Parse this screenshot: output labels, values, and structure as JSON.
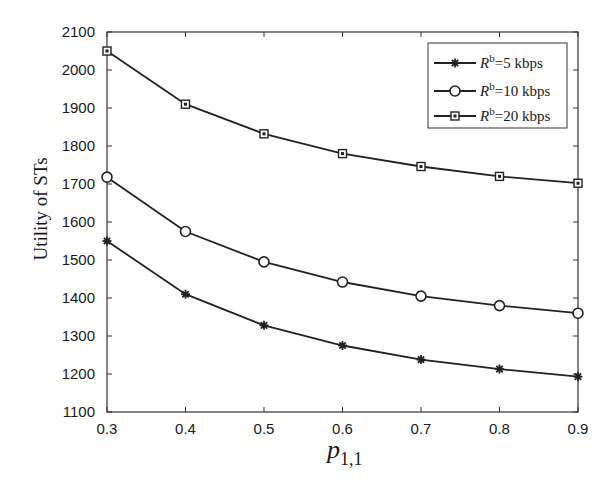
{
  "chart_data": {
    "type": "line",
    "title": "",
    "xlabel": "p_{1,1}",
    "xlabel_main": "p",
    "xlabel_sub": "1,1",
    "ylabel": "Utility of STs",
    "x": [
      0.3,
      0.4,
      0.5,
      0.6,
      0.7,
      0.8,
      0.9
    ],
    "xlim": [
      0.3,
      0.9
    ],
    "ylim": [
      1100,
      2100
    ],
    "xticks": [
      "0.3",
      "0.4",
      "0.5",
      "0.6",
      "0.7",
      "0.8",
      "0.9"
    ],
    "yticks": [
      "1100",
      "1200",
      "1300",
      "1400",
      "1500",
      "1600",
      "1700",
      "1800",
      "1900",
      "2000",
      "2100"
    ],
    "grid": false,
    "legend_position": "upper right",
    "series": [
      {
        "name": "R^b=5 kbps",
        "legend_prefix": "R",
        "legend_sup": "b",
        "legend_suffix": "=5 kbps",
        "marker": "star",
        "values": [
          1550,
          1410,
          1328,
          1275,
          1238,
          1213,
          1193
        ]
      },
      {
        "name": "R^b=10 kbps",
        "legend_prefix": "R",
        "legend_sup": "b",
        "legend_suffix": "=10 kbps",
        "marker": "circle",
        "values": [
          1718,
          1575,
          1495,
          1442,
          1405,
          1380,
          1360
        ]
      },
      {
        "name": "R^b=20 kbps",
        "legend_prefix": "R",
        "legend_sup": "b",
        "legend_suffix": "=20 kbps",
        "marker": "square",
        "values": [
          2050,
          1910,
          1832,
          1780,
          1746,
          1720,
          1702
        ]
      }
    ],
    "colors": {
      "line": "#222222",
      "axis": "#333333",
      "background": "#ffffff"
    }
  }
}
